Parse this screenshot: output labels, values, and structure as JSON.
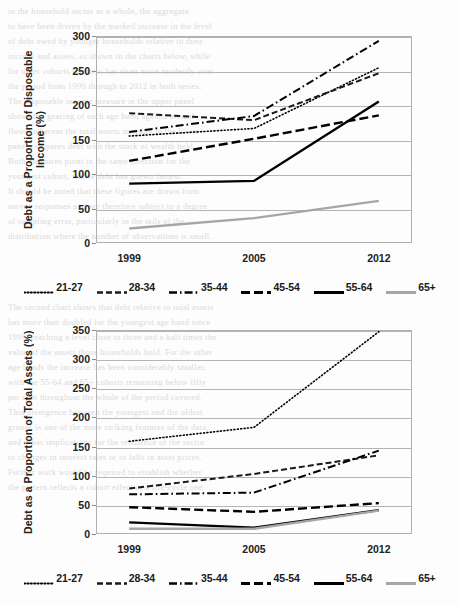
{
  "page": {
    "background_color": "#fdfdfd",
    "ghost_lines": [
      "in the household sector as a whole, the aggregate",
      "to have been driven by the marked increase in the level",
      "of debt owed by younger households relative to their",
      "income and assets, as shown in the charts below, while",
      "for older cohorts the ratio has risen more modestly over",
      "the period from 1999 through to 2012 in both series.",
      "The disposable income measure in the upper panel",
      "shows the gearing of each age band against annual",
      "flows, whereas the total assets measure in the lower",
      "panel compares debt with the stock of wealth held.",
      "Both measures point in the same direction for the",
      "youngest cohort, whose debt has grown fastest.",
      "It should be noted that these figures are drawn from",
      "survey responses and are therefore subject to a degree",
      "of sampling error, particularly in the tails of the",
      "distribution where the number of observations is small."
    ],
    "ghost_lines_lower": [
      "The second chart shows that debt relative to total assets",
      "has more than doubled for the youngest age band since",
      "1999, reaching a level close to three and a half times the",
      "value of the assets those households hold. For the other",
      "age bands the increase has been considerably smaller,",
      "with the 55-64 and 65+ cohorts remaining below fifty",
      "per cent throughout the whole of the period covered.",
      "This divergence between the youngest and the oldest",
      "groups is one of the more striking features of the data,",
      "and it has implications for the resilience of the sector",
      "to changes in interest rates or to falls in asset prices.",
      "Further work would be required to establish whether",
      "the pattern reflects a cohort effect or a life-cycle one."
    ]
  },
  "charts": [
    {
      "id": "top",
      "ylabel": "Debt as a Proportion of Disposable Income (%)",
      "yticks": [
        "0",
        "50",
        "100",
        "150",
        "200",
        "250",
        "300"
      ],
      "xticks": [
        "1999",
        "2005",
        "2012"
      ]
    },
    {
      "id": "bottom",
      "ylabel": "Debt as a Proportion of Total Assets (%)",
      "yticks": [
        "0",
        "50",
        "100",
        "150",
        "200",
        "250",
        "300",
        "350"
      ],
      "xticks": [
        "1999",
        "2005",
        "2012"
      ]
    }
  ],
  "legend": [
    {
      "label": "21-27",
      "style": "dotted",
      "color": "#000000",
      "width": 1.6,
      "dash": "1,2.4"
    },
    {
      "label": "28-34",
      "style": "dashed",
      "color": "#1a1a1a",
      "width": 2.0,
      "dash": "6,3"
    },
    {
      "label": "35-44",
      "style": "dash-dot",
      "color": "#000000",
      "width": 2.0,
      "dash": "8,3,1.6,3"
    },
    {
      "label": "45-54",
      "style": "dashed",
      "color": "#000000",
      "width": 2.4,
      "dash": "9,4"
    },
    {
      "label": "55-64",
      "style": "solid",
      "color": "#000000",
      "width": 2.4,
      "dash": ""
    },
    {
      "label": "65+",
      "style": "solid",
      "color": "#a6a6a6",
      "width": 2.4,
      "dash": ""
    }
  ],
  "chart_data": [
    {
      "type": "line",
      "title": "",
      "id": "debt-to-disposable-income",
      "xlabel": "",
      "ylabel": "Debt as a Proportion of Disposable Income (%)",
      "x": [
        1999,
        2005,
        2012
      ],
      "xtick_labels": [
        "1999",
        "2005",
        "2012"
      ],
      "ylim": [
        0,
        300
      ],
      "ytick_step": 50,
      "grid": true,
      "legend_position": "bottom",
      "series": [
        {
          "name": "21-27",
          "values": [
            155,
            166,
            254
          ]
        },
        {
          "name": "28-34",
          "values": [
            188,
            178,
            246
          ]
        },
        {
          "name": "35-44",
          "values": [
            161,
            184,
            293
          ]
        },
        {
          "name": "45-54",
          "values": [
            119,
            151,
            185
          ]
        },
        {
          "name": "55-64",
          "values": [
            86,
            90,
            205
          ]
        },
        {
          "name": "65+",
          "values": [
            21,
            36,
            61
          ]
        }
      ]
    },
    {
      "type": "line",
      "title": "",
      "id": "debt-to-total-assets",
      "xlabel": "",
      "ylabel": "Debt as a Proportion of Total Assets (%)",
      "x": [
        1999,
        2005,
        2012
      ],
      "xtick_labels": [
        "1999",
        "2005",
        "2012"
      ],
      "ylim": [
        0,
        350
      ],
      "ytick_step": 50,
      "grid": true,
      "legend_position": "bottom",
      "series": [
        {
          "name": "21-27",
          "values": [
            159,
            183,
            347
          ]
        },
        {
          "name": "28-34",
          "values": [
            78,
            103,
            135
          ]
        },
        {
          "name": "35-44",
          "values": [
            68,
            71,
            143
          ]
        },
        {
          "name": "45-54",
          "values": [
            46,
            38,
            53
          ]
        },
        {
          "name": "55-64",
          "values": [
            20,
            11,
            41
          ]
        },
        {
          "name": "65+",
          "values": [
            9,
            9,
            40
          ]
        }
      ]
    }
  ]
}
